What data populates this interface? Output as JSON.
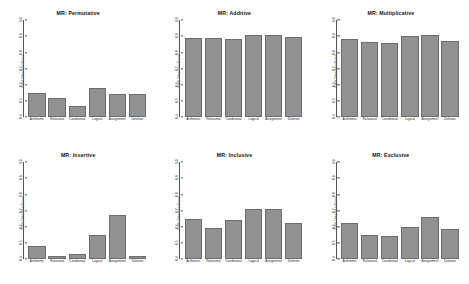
{
  "figure": {
    "background": "#ffffff",
    "bar_fill": "#919191",
    "bar_stroke": "#6d6d6d",
    "rows": 2,
    "cols": 3
  },
  "chart_data": [
    {
      "type": "bar",
      "title": "MR: Permutative",
      "xlabel": "",
      "ylabel": "Fault Detection Score",
      "categories": [
        "Arithmetic",
        "Relational",
        "Conditional",
        "Logical",
        "Assignment",
        "Deletion"
      ],
      "values": [
        0.55,
        0.52,
        0.47,
        0.58,
        0.54,
        0.54
      ],
      "ylim": [
        0.4,
        1.0
      ],
      "yticks": [
        "0.4",
        "0.5",
        "0.6",
        "0.7",
        "0.8",
        "0.9",
        "1.0"
      ],
      "grid": false,
      "legend": "none"
    },
    {
      "type": "bar",
      "title": "MR: Additive",
      "xlabel": "",
      "ylabel": "Fault Detection Score",
      "categories": [
        "Arithmetic",
        "Relational",
        "Conditional",
        "Logical",
        "Assignment",
        "Deletion"
      ],
      "values": [
        0.89,
        0.89,
        0.885,
        0.91,
        0.91,
        0.895
      ],
      "ylim": [
        0.4,
        1.0
      ],
      "yticks": [
        "0.4",
        "0.5",
        "0.6",
        "0.7",
        "0.8",
        "0.9",
        "1.0"
      ],
      "grid": false,
      "legend": "none"
    },
    {
      "type": "bar",
      "title": "MR: Multiplicative",
      "xlabel": "",
      "ylabel": "Fault Detection Score",
      "categories": [
        "Arithmetic",
        "Relational",
        "Conditional",
        "Logical",
        "Assignment",
        "Deletion"
      ],
      "values": [
        0.885,
        0.865,
        0.855,
        0.9,
        0.905,
        0.87
      ],
      "ylim": [
        0.4,
        1.0
      ],
      "yticks": [
        "0.4",
        "0.5",
        "0.6",
        "0.7",
        "0.8",
        "0.9",
        "1.0"
      ],
      "grid": false,
      "legend": "none"
    },
    {
      "type": "bar",
      "title": "MR: Insertive",
      "xlabel": "",
      "ylabel": "Fault Detection Score",
      "categories": [
        "Arithmetic",
        "Relational",
        "Conditional",
        "Logical",
        "Assignment",
        "Deletion"
      ],
      "values": [
        0.48,
        0.42,
        0.43,
        0.55,
        0.67,
        0.42
      ],
      "ylim": [
        0.4,
        1.0
      ],
      "yticks": [
        "0.4",
        "0.5",
        "0.6",
        "0.7",
        "0.8",
        "0.9",
        "1.0"
      ],
      "grid": false,
      "legend": "none"
    },
    {
      "type": "bar",
      "title": "MR: Inclusive",
      "xlabel": "",
      "ylabel": "Fault Detection Score",
      "categories": [
        "Arithmetic",
        "Relational",
        "Conditional",
        "Logical",
        "Assignment",
        "Deletion"
      ],
      "values": [
        0.65,
        0.59,
        0.64,
        0.71,
        0.71,
        0.62
      ],
      "ylim": [
        0.4,
        1.0
      ],
      "yticks": [
        "0.4",
        "0.5",
        "0.6",
        "0.7",
        "0.8",
        "0.9",
        "1.0"
      ],
      "grid": false,
      "legend": "none"
    },
    {
      "type": "bar",
      "title": "MR: Exclusive",
      "xlabel": "",
      "ylabel": "Fault Detection Score",
      "categories": [
        "Arithmetic",
        "Relational",
        "Conditional",
        "Logical",
        "Assignment",
        "Deletion"
      ],
      "values": [
        0.62,
        0.55,
        0.54,
        0.6,
        0.66,
        0.585
      ],
      "ylim": [
        0.4,
        1.0
      ],
      "yticks": [
        "0.4",
        "0.5",
        "0.6",
        "0.7",
        "0.8",
        "0.9",
        "1.0"
      ],
      "grid": false,
      "legend": "none"
    }
  ]
}
